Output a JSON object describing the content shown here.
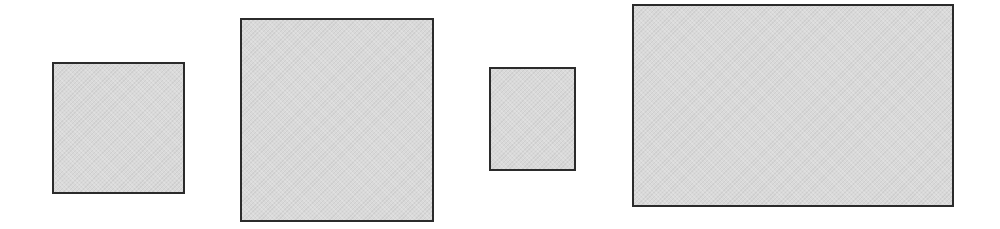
{
  "diagram": {
    "background_color": "#ffffff",
    "stroke_color": "#2b2b2b",
    "fill_color": "#d9d9d9",
    "shapes": [
      {
        "id": "rect-1",
        "type": "rectangle",
        "x": 52,
        "y": 62,
        "width": 133,
        "height": 132
      },
      {
        "id": "rect-2",
        "type": "rectangle",
        "x": 240,
        "y": 18,
        "width": 194,
        "height": 204
      },
      {
        "id": "rect-3",
        "type": "rectangle",
        "x": 489,
        "y": 67,
        "width": 87,
        "height": 104
      },
      {
        "id": "rect-4",
        "type": "rectangle",
        "x": 632,
        "y": 4,
        "width": 322,
        "height": 203
      }
    ]
  }
}
